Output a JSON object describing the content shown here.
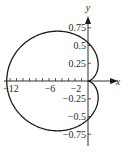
{
  "chart_data": {
    "type": "line",
    "title": "",
    "xlabel": "x",
    "ylabel": "y",
    "curve": "cardioid-like closed curve with cusp at origin (r = 1 - cos θ, scaled)",
    "parametric": {
      "x_scale": 6.25,
      "y_scale": 0.54,
      "description": "x = 6.25·(1−cosθ)·cosθ, y = 0.54·(1−cosθ)·sinθ, θ ∈ [0, 2π]"
    },
    "key_points": [
      {
        "x": 0,
        "y": 0,
        "note": "cusp"
      },
      {
        "x": -12.5,
        "y": 0,
        "note": "leftmost"
      },
      {
        "x": -4.7,
        "y": 0.7,
        "note": "top"
      },
      {
        "x": -4.7,
        "y": -0.7,
        "note": "bottom"
      },
      {
        "x": 0.25,
        "y": 0.3,
        "note": "right bulge upper"
      },
      {
        "x": 0.25,
        "y": -0.3,
        "note": "right bulge lower"
      }
    ],
    "x_ticks": [
      -12,
      -6,
      -2
    ],
    "x_tick_labels": [
      "−12",
      "−6",
      "−2"
    ],
    "x_minor_tick_step": 1,
    "y_ticks": [
      0.75,
      0.5,
      0.25,
      -0.25,
      -0.5,
      -0.75
    ],
    "y_tick_labels": [
      "0.75",
      "0.5",
      "0.25",
      "−0.25",
      "−0.5",
      "−0.75"
    ],
    "xlim": [
      -12.8,
      4.5
    ],
    "ylim": [
      -0.85,
      0.95
    ],
    "grid": false,
    "legend": null
  },
  "axes": {
    "x_label": "x",
    "y_label": "y"
  },
  "colors": {
    "curve": "#1a1a1a",
    "axis": "#1a1a1a",
    "text": "#2a2a2a"
  }
}
